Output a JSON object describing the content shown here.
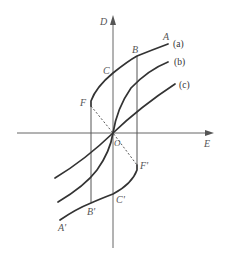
{
  "figure": {
    "type": "hysteresis-diagram",
    "axes": {
      "x_label": "E",
      "y_label": "D",
      "origin_label": "O"
    },
    "curves": [
      {
        "id": "a",
        "label": "(a)",
        "description": "hysteresis loop"
      },
      {
        "id": "b",
        "label": "(b)",
        "description": "curve through origin"
      },
      {
        "id": "c",
        "label": "(c)",
        "description": "curve through origin"
      }
    ],
    "points": {
      "A": "A",
      "B": "B",
      "C": "C",
      "F": "F",
      "A_prime": "A'",
      "B_prime": "B'",
      "C_prime": "C'",
      "F_prime": "F'"
    },
    "colors": {
      "curve": "#333333",
      "axis": "#666666",
      "label": "#555555"
    }
  }
}
